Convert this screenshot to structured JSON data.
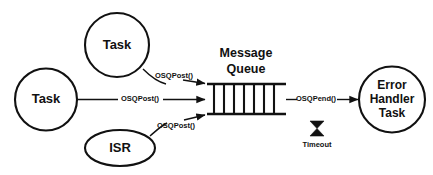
{
  "diagram": {
    "background_color": "#ffffff",
    "stroke_color": "#111111",
    "nodes": {
      "task_left": {
        "label": "Task",
        "shape": "circle"
      },
      "task_top": {
        "label": "Task",
        "shape": "circle"
      },
      "isr": {
        "label": "ISR",
        "shape": "ellipse"
      },
      "error_handler": {
        "line1": "Error",
        "line2": "Handler",
        "line3": "Task",
        "shape": "circle"
      }
    },
    "queue": {
      "title_line1": "Message",
      "title_line2": "Queue",
      "slot_count": 7
    },
    "edges": {
      "post_top": {
        "label": "OSQPost()"
      },
      "post_middle": {
        "label": "OSQPost()"
      },
      "post_bottom": {
        "label": "OSQPost()"
      },
      "pend": {
        "label": "OSQPend()"
      }
    },
    "timeout": {
      "label": "Timeout",
      "icon": "hourglass-icon"
    }
  }
}
